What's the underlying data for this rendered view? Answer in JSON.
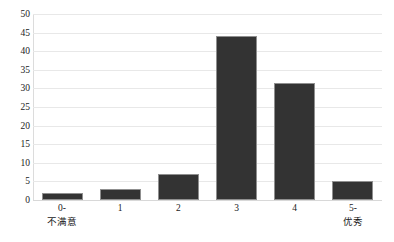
{
  "chart_data": {
    "type": "bar",
    "title": "",
    "subtitle": "",
    "xlabel": "",
    "ylabel": "",
    "categories": [
      "0-",
      "1",
      "2",
      "3",
      "4",
      "5-"
    ],
    "category_sublabels": [
      "不满意",
      "",
      "",
      "",
      "",
      "优秀"
    ],
    "values": [
      2,
      3,
      7,
      44,
      31.5,
      5
    ],
    "ylim": [
      0,
      50
    ],
    "ytick_labels": [
      "50",
      "45",
      "40",
      "35",
      "30",
      "25",
      "20",
      "15",
      "10",
      "5",
      "0"
    ],
    "ytick_values": [
      50,
      45,
      40,
      35,
      30,
      25,
      20,
      15,
      10,
      5,
      0
    ],
    "grid": true,
    "legend": false,
    "legend_position": "none",
    "bar_color": "#333333",
    "bar_edge_color": "#8f8f8f",
    "grid_color": "#e8e8e8",
    "background_color": "#ffffff"
  }
}
